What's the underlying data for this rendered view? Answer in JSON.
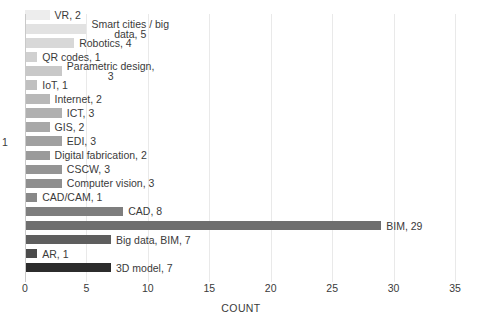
{
  "chart_data": {
    "type": "bar",
    "orientation": "horizontal",
    "title": "",
    "xlabel": "COUNT",
    "ylabel": "",
    "xlim": [
      0,
      35
    ],
    "xticks": [
      "0",
      "5",
      "10",
      "15",
      "20",
      "25",
      "30",
      "35"
    ],
    "grid": true,
    "legend": false,
    "categories": [
      "VR",
      "Smart cities / big data",
      "Robotics",
      "QR codes",
      "Parametric design",
      "IoT",
      "Internet",
      "ICT",
      "GIS",
      "EDI",
      "Digital fabrication",
      "CSCW",
      "Computer vision",
      "CAD/CAM",
      "CAD",
      "BIM",
      "Big data, BIM",
      "AR",
      "3D model"
    ],
    "values": [
      2,
      5,
      4,
      1,
      3,
      1,
      2,
      3,
      2,
      3,
      2,
      3,
      3,
      1,
      8,
      29,
      7,
      1,
      7
    ],
    "data_labels": [
      "VR, 2",
      "Smart cities / big\ndata, 5",
      "Robotics, 4",
      "QR codes, 1",
      "Parametric design,\n3",
      "IoT, 1",
      "Internet, 2",
      "ICT, 3",
      "GIS, 2",
      "EDI, 3",
      "Digital fabrication, 2",
      "CSCW, 3",
      "Computer vision, 3",
      "CAD/CAM, 1",
      "CAD, 8",
      "BIM, 29",
      "Big data, BIM, 7",
      "AR, 1",
      "3D model, 7"
    ],
    "bar_colors": [
      "#ededed",
      "#e2e2e2",
      "#d8d8d8",
      "#d0d0d0",
      "#c8c8c8",
      "#c0c0c0",
      "#b8b8b8",
      "#b0b0b0",
      "#a8a8a8",
      "#a0a0a0",
      "#9a9a9a",
      "#949494",
      "#8e8e8e",
      "#888888",
      "#7e7e7e",
      "#6e6e6e",
      "#5e5e5e",
      "#4a4a4a",
      "#2c2c2c"
    ],
    "stray_label": "1",
    "grid_color": "#e9e9e9",
    "text_color": "#3a3a3a"
  }
}
